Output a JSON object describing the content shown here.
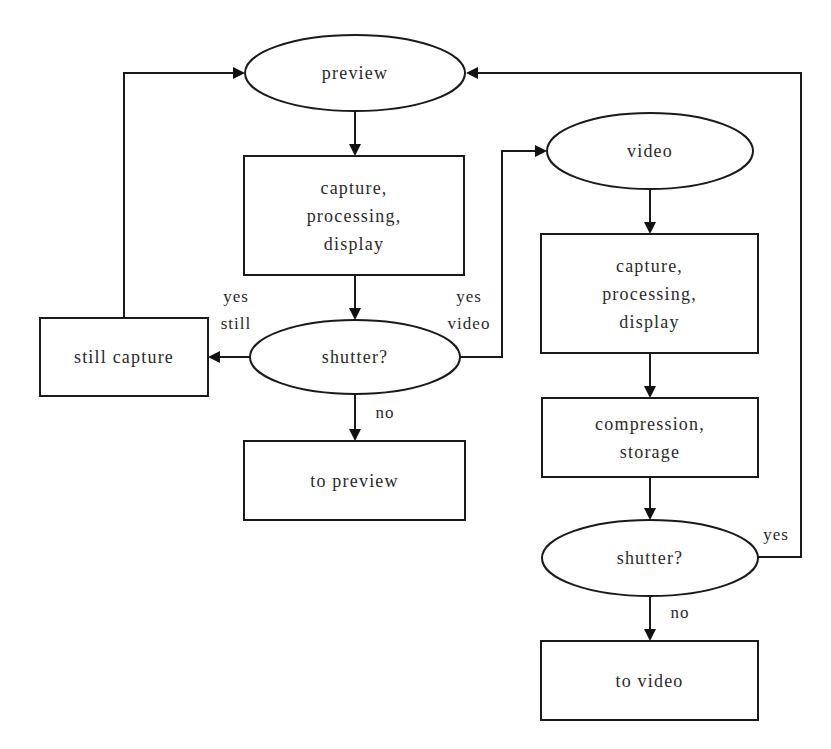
{
  "diagram": {
    "type": "flowchart",
    "colors": {
      "stroke": "#1a1a1a",
      "text": "#2a2a2a",
      "background": "#ffffff"
    },
    "nodes": [
      {
        "id": "preview",
        "shape": "ellipse",
        "cx": 355,
        "cy": 73,
        "rx": 110,
        "ry": 38,
        "lines": [
          "preview"
        ]
      },
      {
        "id": "preview_capture",
        "shape": "rect",
        "x": 244,
        "y": 156,
        "w": 220,
        "h": 119,
        "lines": [
          "capture,",
          "processing,",
          "display"
        ]
      },
      {
        "id": "shutter_1",
        "shape": "ellipse",
        "cx": 355,
        "cy": 357,
        "rx": 105,
        "ry": 37,
        "lines": [
          "shutter?"
        ]
      },
      {
        "id": "still_capture",
        "shape": "rect",
        "x": 40,
        "y": 318,
        "w": 168,
        "h": 78,
        "lines": [
          "still capture"
        ]
      },
      {
        "id": "to_preview",
        "shape": "rect",
        "x": 244,
        "y": 441,
        "w": 221,
        "h": 79,
        "lines": [
          "to preview"
        ]
      },
      {
        "id": "video",
        "shape": "ellipse",
        "cx": 650,
        "cy": 151,
        "rx": 103,
        "ry": 38,
        "lines": [
          "video"
        ]
      },
      {
        "id": "video_capture",
        "shape": "rect",
        "x": 541,
        "y": 234,
        "w": 217,
        "h": 119,
        "lines": [
          "capture,",
          "processing,",
          "display"
        ]
      },
      {
        "id": "compression",
        "shape": "rect",
        "x": 542,
        "y": 398,
        "w": 216,
        "h": 79,
        "lines": [
          "compression,",
          "storage"
        ]
      },
      {
        "id": "shutter_2",
        "shape": "ellipse",
        "cx": 650,
        "cy": 558,
        "rx": 108,
        "ry": 38,
        "lines": [
          "shutter?"
        ]
      },
      {
        "id": "to_video",
        "shape": "rect",
        "x": 541,
        "y": 641,
        "w": 217,
        "h": 79,
        "lines": [
          "to video"
        ]
      }
    ],
    "edges": [
      {
        "id": "preview-to-capture",
        "from": "preview",
        "to": "preview_capture",
        "points": [
          [
            355,
            111
          ],
          [
            355,
            156
          ]
        ]
      },
      {
        "id": "capture-to-shutter1",
        "from": "preview_capture",
        "to": "shutter_1",
        "points": [
          [
            355,
            275
          ],
          [
            355,
            320
          ]
        ]
      },
      {
        "id": "shutter1-to-still",
        "from": "shutter_1",
        "to": "still_capture",
        "points": [
          [
            250,
            357
          ],
          [
            208,
            357
          ]
        ]
      },
      {
        "id": "still-to-preview",
        "from": "still_capture",
        "to": "preview",
        "points": [
          [
            124,
            318
          ],
          [
            124,
            73
          ],
          [
            245,
            73
          ]
        ]
      },
      {
        "id": "shutter1-to-topreview",
        "from": "shutter_1",
        "to": "to_preview",
        "points": [
          [
            355,
            394
          ],
          [
            355,
            441
          ]
        ]
      },
      {
        "id": "shutter1-to-video",
        "from": "shutter_1",
        "to": "video",
        "points": [
          [
            460,
            357
          ],
          [
            502,
            357
          ],
          [
            502,
            151
          ],
          [
            547,
            151
          ]
        ]
      },
      {
        "id": "video-to-capture",
        "from": "video",
        "to": "video_capture",
        "points": [
          [
            650,
            189
          ],
          [
            650,
            234
          ]
        ]
      },
      {
        "id": "capture-to-compression",
        "from": "video_capture",
        "to": "compression",
        "points": [
          [
            650,
            353
          ],
          [
            650,
            398
          ]
        ]
      },
      {
        "id": "compression-to-shutter2",
        "from": "compression",
        "to": "shutter_2",
        "points": [
          [
            650,
            477
          ],
          [
            650,
            520
          ]
        ]
      },
      {
        "id": "shutter2-to-preview",
        "from": "shutter_2",
        "to": "preview",
        "points": [
          [
            758,
            557
          ],
          [
            801,
            557
          ],
          [
            801,
            73
          ],
          [
            466,
            73
          ]
        ]
      },
      {
        "id": "shutter2-to-tovideo",
        "from": "shutter_2",
        "to": "to_video",
        "points": [
          [
            650,
            596
          ],
          [
            650,
            641
          ]
        ]
      }
    ],
    "edge_labels": [
      {
        "id": "yes-still",
        "x": 236,
        "lines": [
          "yes",
          "still"
        ],
        "y": 302,
        "line_height": 27
      },
      {
        "id": "yes-video",
        "x": 469,
        "lines": [
          "yes",
          "video"
        ],
        "y": 302,
        "line_height": 27
      },
      {
        "id": "no-preview",
        "x": 385,
        "lines": [
          "no"
        ],
        "y": 418,
        "line_height": 27
      },
      {
        "id": "yes-loop",
        "x": 776,
        "lines": [
          "yes"
        ],
        "y": 540,
        "line_height": 27
      },
      {
        "id": "no-video",
        "x": 680,
        "lines": [
          "no"
        ],
        "y": 618,
        "line_height": 27
      }
    ]
  }
}
